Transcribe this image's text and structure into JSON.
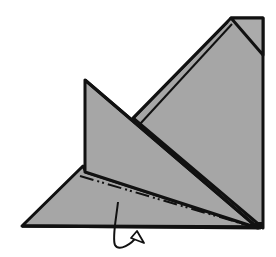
{
  "diagram": {
    "type": "origami-fold-step",
    "colors": {
      "paper": "#a6a6a6",
      "line": "#111111",
      "background": "#ffffff"
    },
    "shapes": {
      "back_sheet": "231,18 263,18 263,228 133,118",
      "corner_fold": "231,18 263,18 263,55",
      "inner_layer_line": "225,22 140,116",
      "left_flap": "85,80 85,172 258,228",
      "bottom_triangle": "22,225 85,165 85,172 258,228 260,227",
      "fold_line": "82,172 255,226"
    },
    "arrow": {
      "kind": "loop-arrow",
      "meaning": "fold behind"
    }
  }
}
